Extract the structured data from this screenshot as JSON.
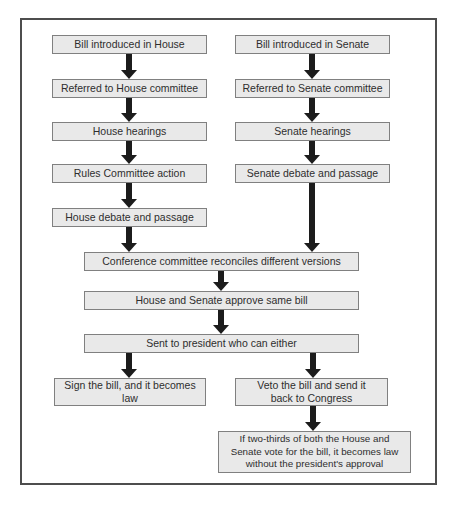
{
  "flow": {
    "house_track": [
      "Bill introduced in House",
      "Referred to House committee",
      "House hearings",
      "Rules Committee action",
      "House debate and passage"
    ],
    "senate_track": [
      "Bill introduced in Senate",
      "Referred to Senate committee",
      "Senate hearings",
      "Senate debate and passage"
    ],
    "merged_track": [
      "Conference committee reconciles different versions",
      "House and Senate approve same bill",
      "Sent to president who can either"
    ],
    "sign_outcome": {
      "label": "Sign the bill, and it becomes law",
      "lines": [
        "Sign the bill, and it becomes",
        "law"
      ]
    },
    "veto_outcome": {
      "label": "Veto the bill and send it back to Congress",
      "lines": [
        "Veto the bill and send it",
        "back to Congress"
      ]
    },
    "override_outcome": {
      "label": "If two-thirds of both the House and Senate vote for the bill, it becomes law without the president's approval",
      "lines": [
        "If two-thirds of both the House and",
        "Senate vote for the bill, it becomes law",
        "without the president's approval"
      ]
    },
    "colors": {
      "background": "#ffffff",
      "frame_border": "#4d4d4d",
      "box_fill": "#e9e9e9",
      "box_border": "#808080",
      "arrow": "#1c1c1c",
      "text": "#2e2e2e"
    }
  }
}
